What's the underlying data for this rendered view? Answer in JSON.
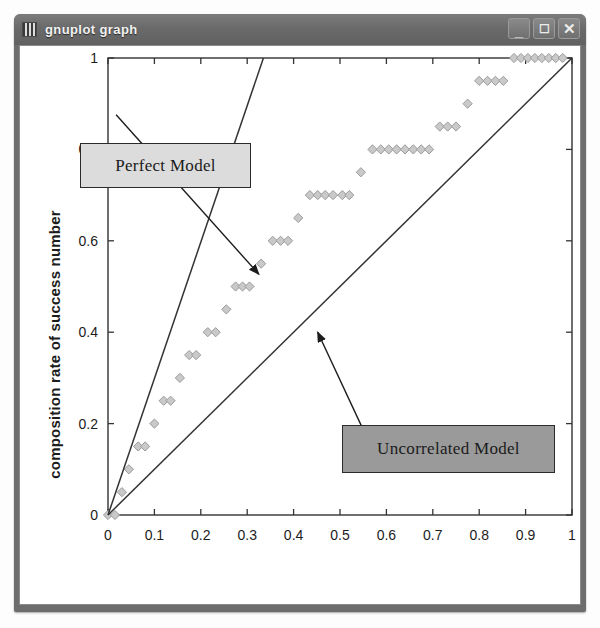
{
  "window": {
    "title": "gnuplot graph",
    "icon": "gnuplot-icon",
    "buttons": [
      {
        "name": "minimize",
        "glyph": "_"
      },
      {
        "name": "maximize",
        "glyph": "☐"
      },
      {
        "name": "close",
        "glyph": "✕"
      }
    ]
  },
  "annotations": {
    "perfect": {
      "label": "Perfect Model",
      "fill": "#dcdcdc",
      "border": "#2b2b2b"
    },
    "uncorrelated": {
      "label": "Uncorrelated Model",
      "fill": "#9a9a9a",
      "border": "#2b2b2b"
    }
  },
  "chart_data": {
    "type": "scatter",
    "title": "",
    "xlabel": "composition rate in descending prob",
    "ylabel": "composition rate of success number",
    "xlim": [
      0,
      1
    ],
    "ylim": [
      0,
      1
    ],
    "xticks": [
      "0",
      "0.1",
      "0.2",
      "0.3",
      "0.4",
      "0.5",
      "0.6",
      "0.7",
      "0.8",
      "0.9",
      "1"
    ],
    "xtickvals": [
      0,
      0.1,
      0.2,
      0.3,
      0.4,
      0.5,
      0.6,
      0.7,
      0.8,
      0.9,
      1
    ],
    "yticks": [
      "0",
      "0.2",
      "0.4",
      "0.6",
      "0.8",
      "1"
    ],
    "ytickvals": [
      0,
      0.2,
      0.4,
      0.6,
      0.8,
      1
    ],
    "grid": false,
    "legend": "none",
    "border": "full-box",
    "point_marker": "diamond",
    "point_fill": "#c9c9c9",
    "point_stroke": "#9b9b9b",
    "line_color": "#333333",
    "series": [
      {
        "name": "lift curve",
        "type": "scatter",
        "points": [
          [
            0.0,
            0.0
          ],
          [
            0.015,
            0.0
          ],
          [
            0.03,
            0.05
          ],
          [
            0.045,
            0.1
          ],
          [
            0.065,
            0.15
          ],
          [
            0.08,
            0.15
          ],
          [
            0.1,
            0.2
          ],
          [
            0.12,
            0.25
          ],
          [
            0.135,
            0.25
          ],
          [
            0.155,
            0.3
          ],
          [
            0.175,
            0.35
          ],
          [
            0.19,
            0.35
          ],
          [
            0.215,
            0.4
          ],
          [
            0.232,
            0.4
          ],
          [
            0.255,
            0.45
          ],
          [
            0.275,
            0.5
          ],
          [
            0.29,
            0.5
          ],
          [
            0.305,
            0.5
          ],
          [
            0.33,
            0.55
          ],
          [
            0.355,
            0.6
          ],
          [
            0.372,
            0.6
          ],
          [
            0.388,
            0.6
          ],
          [
            0.41,
            0.65
          ],
          [
            0.435,
            0.7
          ],
          [
            0.452,
            0.7
          ],
          [
            0.468,
            0.7
          ],
          [
            0.485,
            0.7
          ],
          [
            0.505,
            0.7
          ],
          [
            0.52,
            0.7
          ],
          [
            0.545,
            0.75
          ],
          [
            0.57,
            0.8
          ],
          [
            0.588,
            0.8
          ],
          [
            0.605,
            0.8
          ],
          [
            0.622,
            0.8
          ],
          [
            0.64,
            0.8
          ],
          [
            0.658,
            0.8
          ],
          [
            0.675,
            0.8
          ],
          [
            0.692,
            0.8
          ],
          [
            0.715,
            0.85
          ],
          [
            0.732,
            0.85
          ],
          [
            0.75,
            0.85
          ],
          [
            0.775,
            0.9
          ],
          [
            0.8,
            0.95
          ],
          [
            0.818,
            0.95
          ],
          [
            0.835,
            0.95
          ],
          [
            0.852,
            0.95
          ],
          [
            0.875,
            1.0
          ],
          [
            0.89,
            1.0
          ],
          [
            0.905,
            1.0
          ],
          [
            0.92,
            1.0
          ],
          [
            0.935,
            1.0
          ],
          [
            0.95,
            1.0
          ],
          [
            0.965,
            1.0
          ],
          [
            0.98,
            1.0
          ]
        ]
      },
      {
        "name": "Perfect Model",
        "type": "line",
        "points": [
          [
            0.0,
            0.0
          ],
          [
            0.335,
            1.0
          ]
        ]
      },
      {
        "name": "Uncorrelated Model",
        "type": "line",
        "points": [
          [
            0.0,
            0.0
          ],
          [
            1.0,
            1.0
          ]
        ]
      }
    ],
    "arrows": [
      {
        "name": "perfect-model-arrow",
        "from": [
          0.0175,
          0.876
        ],
        "to": [
          0.325,
          0.527
        ]
      },
      {
        "name": "uncorrelated-model-arrow",
        "from": [
          0.565,
          0.154
        ],
        "to": [
          0.452,
          0.4
        ]
      }
    ]
  }
}
